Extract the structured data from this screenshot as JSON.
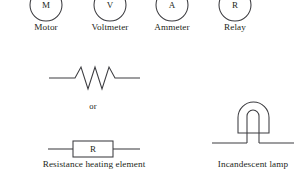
{
  "figure": {
    "background_color": "#ffffff",
    "stroke_color": "#3c3c40",
    "text_color": "#231f20",
    "width": 307,
    "height": 183
  },
  "device_symbols": [
    {
      "glyph": "M",
      "label": "Motor",
      "symbol": "circle-with-letter",
      "cx": 46,
      "cy": 5,
      "r": 16,
      "label_x": 46,
      "label_y": 29
    },
    {
      "glyph": "V",
      "label": "Voltmeter",
      "symbol": "circle-with-letter",
      "cx": 110,
      "cy": 5,
      "r": 16,
      "label_x": 110,
      "label_y": 29
    },
    {
      "glyph": "A",
      "label": "Ammeter",
      "symbol": "circle-with-letter",
      "cx": 172,
      "cy": 5,
      "r": 16,
      "label_x": 172,
      "label_y": 29
    },
    {
      "glyph": "R",
      "label": "Relay",
      "symbol": "circle-with-letter",
      "cx": 235,
      "cy": 5,
      "r": 16,
      "label_x": 235,
      "label_y": 29
    }
  ],
  "resistor_group": {
    "label": "Resistance heating element",
    "label_x": 94,
    "label_y": 166,
    "zigzag": {
      "symbol": "resistor-zigzag",
      "lead_left_x1": 49,
      "lead_left_x2": 75,
      "lead_right_x1": 117,
      "lead_right_x2": 140,
      "baseline_y": 78,
      "peak_y": 67,
      "valley_y": 89,
      "peaks": 3,
      "points": "49,78 75,78 81,67 88,89 95,67 102,89 109,67 115,78 140,78"
    },
    "or_text": {
      "text": "or",
      "x": 93,
      "y": 109
    },
    "boxed": {
      "symbol": "resistor-box",
      "glyph": "R",
      "box_x": 73,
      "box_y": 141,
      "box_width": 40,
      "box_height": 16,
      "lead_left_x1": 48,
      "lead_left_x2": 73,
      "lead_right_x1": 113,
      "lead_right_x2": 140,
      "baseline_y": 149
    }
  },
  "lamp_group": {
    "label": "Incandescent lamp",
    "label_x": 253,
    "label_y": 166,
    "symbol": "incandescent-lamp",
    "envelope": {
      "left_x": 238,
      "right_x": 269,
      "top_y": 102,
      "bottom_y": 133,
      "arch_radius": 15.5
    },
    "filament": {
      "left_x": 247,
      "right_x": 259,
      "top_y": 110,
      "bottom_y": 143,
      "arch_radius": 6
    },
    "wires": {
      "y": 143,
      "left_x1": 212,
      "left_x2": 247,
      "right_x1": 259,
      "right_x2": 294
    }
  }
}
